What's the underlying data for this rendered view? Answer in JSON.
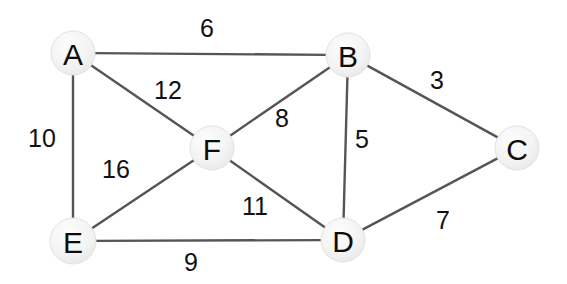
{
  "diagram": {
    "type": "weighted-undirected-graph",
    "canvas": {
      "width": 567,
      "height": 284,
      "background": "#ffffff"
    },
    "style": {
      "node_fill": "#f2f2f2",
      "node_highlight": "#fcfcfc",
      "node_stroke": "#e2e2e2",
      "edge_color": "#555558",
      "label_color": "#111111",
      "node_radius": 22
    },
    "nodes": [
      {
        "id": "A",
        "label": "A",
        "x": 73,
        "y": 53,
        "r": 22
      },
      {
        "id": "B",
        "label": "B",
        "x": 348,
        "y": 55,
        "r": 22
      },
      {
        "id": "C",
        "label": "C",
        "x": 517,
        "y": 148,
        "r": 22
      },
      {
        "id": "D",
        "label": "D",
        "x": 343,
        "y": 240,
        "r": 22
      },
      {
        "id": "E",
        "label": "E",
        "x": 73,
        "y": 241,
        "r": 23
      },
      {
        "id": "F",
        "label": "F",
        "x": 212,
        "y": 148,
        "r": 22
      }
    ],
    "edges": [
      {
        "id": "AB",
        "from": "A",
        "to": "B",
        "weight": 6,
        "label_x": 200,
        "label_y": 16
      },
      {
        "id": "AF",
        "from": "A",
        "to": "F",
        "weight": 12,
        "label_x": 154,
        "label_y": 78
      },
      {
        "id": "AE",
        "from": "A",
        "to": "E",
        "weight": 10,
        "label_x": 28,
        "label_y": 126
      },
      {
        "id": "BC",
        "from": "B",
        "to": "C",
        "weight": 3,
        "label_x": 430,
        "label_y": 68
      },
      {
        "id": "BF",
        "from": "B",
        "to": "F",
        "weight": 8,
        "label_x": 275,
        "label_y": 106
      },
      {
        "id": "BD",
        "from": "B",
        "to": "D",
        "weight": 5,
        "label_x": 355,
        "label_y": 127
      },
      {
        "id": "CD",
        "from": "C",
        "to": "D",
        "weight": 7,
        "label_x": 436,
        "label_y": 208
      },
      {
        "id": "EF",
        "from": "E",
        "to": "F",
        "weight": 16,
        "label_x": 102,
        "label_y": 157
      },
      {
        "id": "FD",
        "from": "F",
        "to": "D",
        "weight": 11,
        "label_x": 242,
        "label_y": 194
      },
      {
        "id": "ED",
        "from": "E",
        "to": "D",
        "weight": 9,
        "label_x": 184,
        "label_y": 250
      }
    ]
  }
}
